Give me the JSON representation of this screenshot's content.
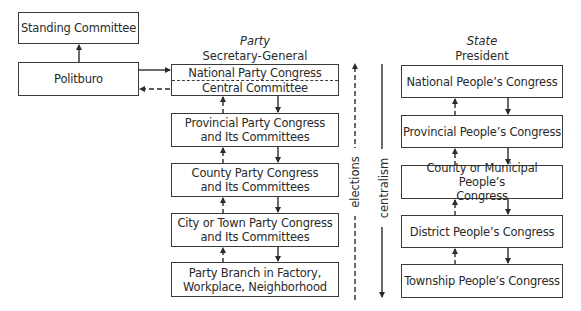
{
  "left": {
    "standing_committee": "Standing Committee",
    "politburo": "Politburo"
  },
  "party": {
    "header_title": "Party",
    "header_subtitle": "Secretary-General",
    "boxes": [
      {
        "top": "National Party Congress",
        "bottom": "Central Committee"
      },
      {
        "line1": "Provincial Party Congress",
        "line2": "and Its Committees"
      },
      {
        "line1": "County Party Congress",
        "line2": "and Its Committees"
      },
      {
        "line1": "City or Town Party Congress",
        "line2": "and Its Committees"
      },
      {
        "line1": "Party Branch in Factory,",
        "line2": "Workplace, Neighborhood"
      }
    ]
  },
  "axis": {
    "elections": "elections",
    "centralism": "centralism"
  },
  "state": {
    "header_title": "State",
    "header_subtitle": "President",
    "boxes": [
      {
        "line1": "National People’s Congress"
      },
      {
        "line1": "Provincial People’s Congress"
      },
      {
        "line1": "County or Municipal People’s",
        "line2": "Congress"
      },
      {
        "line1": "District People’s Congress"
      },
      {
        "line1": "Township People’s Congress"
      }
    ]
  }
}
